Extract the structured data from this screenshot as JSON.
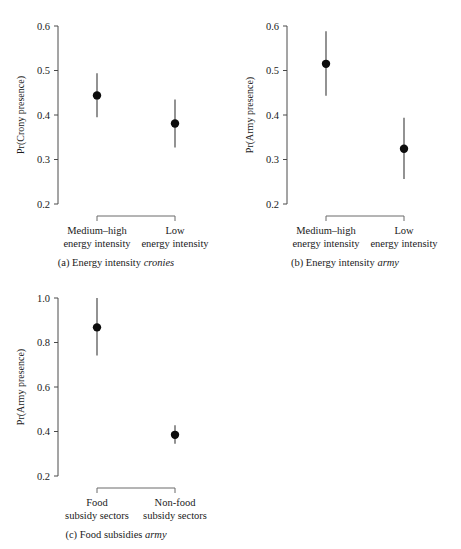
{
  "figure": {
    "background_color": "#ffffff",
    "marker_color": "#0d0d0d",
    "axis_color": "#4a4a4a",
    "bracket_color": "#6a6a6a"
  },
  "chart_data": [
    {
      "id": "a",
      "type": "scatter",
      "title": "",
      "caption_prefix": "(a) Energy intensity ",
      "caption_emphasis": "cronies",
      "xlabel": "",
      "ylabel": "Pr(Crony presence)",
      "ylim": [
        0.2,
        0.6
      ],
      "yticks": [
        0.2,
        0.3,
        0.4,
        0.5,
        0.6
      ],
      "ytick_labels": [
        "0.2",
        "0.3",
        "0.4",
        "0.5",
        "0.6"
      ],
      "grid": false,
      "legend": "none",
      "categories": [
        "Medium–high energy intensity",
        "Low energy intensity"
      ],
      "category_lines": [
        [
          "Medium–high",
          "energy intensity"
        ],
        [
          "Low",
          "energy intensity"
        ]
      ],
      "values": [
        0.444,
        0.381
      ],
      "ci_low": [
        0.395,
        0.327
      ],
      "ci_high": [
        0.494,
        0.435
      ]
    },
    {
      "id": "b",
      "type": "scatter",
      "title": "",
      "caption_prefix": "(b) Energy intensity ",
      "caption_emphasis": "army",
      "xlabel": "",
      "ylabel": "Pr(Army presence)",
      "ylim": [
        0.2,
        0.6
      ],
      "yticks": [
        0.2,
        0.3,
        0.4,
        0.5,
        0.6
      ],
      "ytick_labels": [
        "0.2",
        "0.3",
        "0.4",
        "0.5",
        "0.6"
      ],
      "grid": false,
      "legend": "none",
      "categories": [
        "Medium–high energy intensity",
        "Low energy intensity"
      ],
      "category_lines": [
        [
          "Medium–high",
          "energy intensity"
        ],
        [
          "Low",
          "energy intensity"
        ]
      ],
      "values": [
        0.515,
        0.324
      ],
      "ci_low": [
        0.443,
        0.256
      ],
      "ci_high": [
        0.588,
        0.394
      ]
    },
    {
      "id": "c",
      "type": "scatter",
      "title": "",
      "caption_prefix": "(c) Food subsidies ",
      "caption_emphasis": "army",
      "xlabel": "",
      "ylabel": "Pr(Army presence)",
      "ylim": [
        0.2,
        1.0
      ],
      "yticks": [
        0.2,
        0.4,
        0.6,
        0.8,
        1.0
      ],
      "ytick_labels": [
        "0.2",
        "0.4",
        "0.6",
        "0.8",
        "1.0"
      ],
      "grid": false,
      "legend": "none",
      "categories": [
        "Food subsidy sectors",
        "Non-food subsidy sectors"
      ],
      "category_lines": [
        [
          "Food",
          "subsidy sectors"
        ],
        [
          "Non-food",
          "subsidy sectors"
        ]
      ],
      "values": [
        0.868,
        0.385
      ],
      "ci_low": [
        0.742,
        0.345
      ],
      "ci_high": [
        1.0,
        0.428
      ]
    }
  ]
}
